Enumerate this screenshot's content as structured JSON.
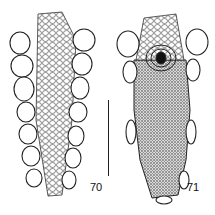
{
  "figure": {
    "panels": [
      {
        "number": "70",
        "view": "scaly specimen, dorsal view with large lateral plates"
      },
      {
        "number": "71",
        "view": "specimen with dense granular surface and central opening"
      }
    ],
    "scale_bar": {
      "present": true
    }
  }
}
